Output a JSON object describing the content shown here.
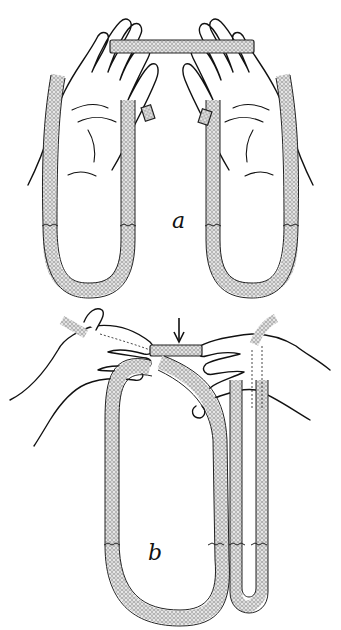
{
  "figure": {
    "panels": [
      {
        "id": "a",
        "label": "a",
        "description": "Two open hands holding a flat band stretched between the fingertips; each hand has a band hanging down in a U-shaped loop"
      },
      {
        "id": "b",
        "label": "b",
        "description": "Two hands gripping a band over an elongated loop; arrow points to the band segment between the hands"
      }
    ],
    "annotations": [
      {
        "type": "arrow",
        "direction": "down",
        "panel": "b"
      }
    ],
    "colors": {
      "ink": "#111111",
      "background": "#ffffff",
      "rope_fill": "#d9d9d9"
    }
  }
}
